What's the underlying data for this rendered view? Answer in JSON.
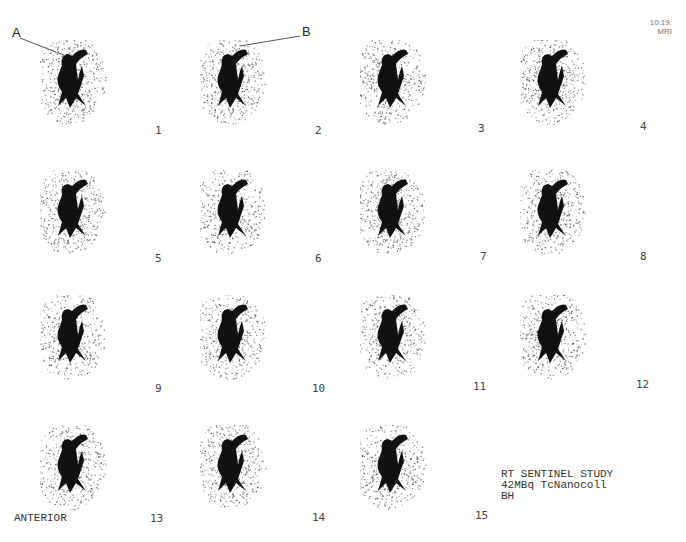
{
  "title": "RT SENTINEL STUDY",
  "info": {
    "line1": "RT SENTINEL STUDY",
    "line2": "42MBq TcNanocoll",
    "line3": "BH"
  },
  "corner": {
    "line1": "10:19:",
    "line2": "MRI"
  },
  "view_label": "ANTERIOR",
  "annotations": {
    "a": "A",
    "b": "B"
  },
  "frames": [
    {
      "n": "1"
    },
    {
      "n": "2"
    },
    {
      "n": "3"
    },
    {
      "n": "4"
    },
    {
      "n": "5"
    },
    {
      "n": "6"
    },
    {
      "n": "7"
    },
    {
      "n": "8"
    },
    {
      "n": "9"
    },
    {
      "n": "10"
    },
    {
      "n": "11"
    },
    {
      "n": "12"
    },
    {
      "n": "13"
    },
    {
      "n": "14"
    },
    {
      "n": "15"
    }
  ]
}
